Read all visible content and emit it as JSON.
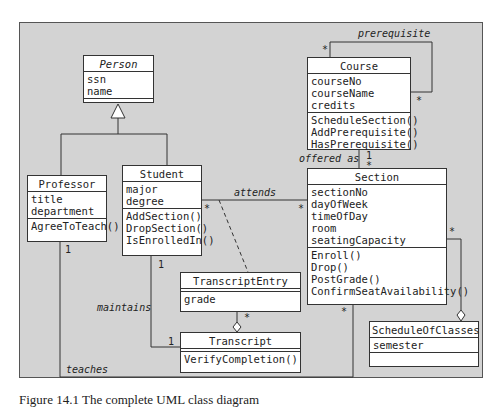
{
  "classes": {
    "person": {
      "name": "Person",
      "attributes": [
        "ssn",
        "name"
      ],
      "operations": []
    },
    "professor": {
      "name": "Professor",
      "attributes": [
        "title",
        "department"
      ],
      "operations": [
        "AgreeToTeach()"
      ]
    },
    "student": {
      "name": "Student",
      "attributes": [
        "major",
        "degree"
      ],
      "operations": [
        "AddSection()",
        "DropSection()",
        "IsEnrolledIn()"
      ]
    },
    "course": {
      "name": "Course",
      "attributes": [
        "courseNo",
        "courseName",
        "credits"
      ],
      "operations": [
        "ScheduleSection()",
        "AddPrerequisite()",
        "HasPrerequisite()"
      ]
    },
    "section": {
      "name": "Section",
      "attributes": [
        "sectionNo",
        "dayOfWeek",
        "timeOfDay",
        "room",
        "seatingCapacity"
      ],
      "operations": [
        "Enroll()",
        "Drop()",
        "PostGrade()",
        "ConfirmSeatAvailability()"
      ]
    },
    "transcript_entry": {
      "name": "TranscriptEntry",
      "attributes": [
        "grade"
      ],
      "operations": []
    },
    "transcript": {
      "name": "Transcript",
      "attributes": [],
      "operations": [
        "VerifyCompletion()"
      ]
    },
    "schedule_of_classes": {
      "name": "ScheduleOfClasses",
      "attributes": [
        "semester"
      ],
      "operations": []
    }
  },
  "associations": {
    "prerequisite": "prerequisite",
    "offered_as": "offered as",
    "attends": "attends",
    "maintains": "maintains",
    "teaches": "teaches"
  },
  "multiplicities": {
    "star": "*",
    "one": "1"
  },
  "caption": "Figure 14.1  The complete UML class diagram"
}
